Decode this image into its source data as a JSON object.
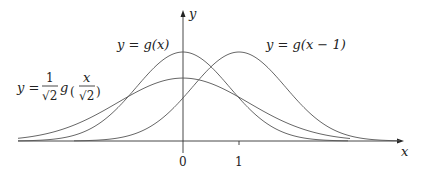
{
  "diagram": {
    "axes": {
      "x_label": "x",
      "y_label": "y",
      "x_ticks": [
        {
          "value": 0,
          "label": "0"
        },
        {
          "value": 1,
          "label": "1"
        }
      ]
    },
    "curves": [
      {
        "id": "g",
        "label": "y = g(x)",
        "shift": 0,
        "scale": 1
      },
      {
        "id": "g-shift",
        "label": "y = g(x − 1)",
        "shift": 1,
        "scale": 1
      },
      {
        "id": "g-scaled",
        "label_prefix": "y =",
        "label_num": "1",
        "label_den": "√2",
        "label_fn": "g",
        "label_arg_num": "x",
        "label_arg_den": "√2",
        "shift": 0,
        "scale": 1.41421
      }
    ],
    "colors": {
      "axis": "#333333",
      "curve": "#555555",
      "text": "#222222",
      "background": "#ffffff"
    }
  }
}
